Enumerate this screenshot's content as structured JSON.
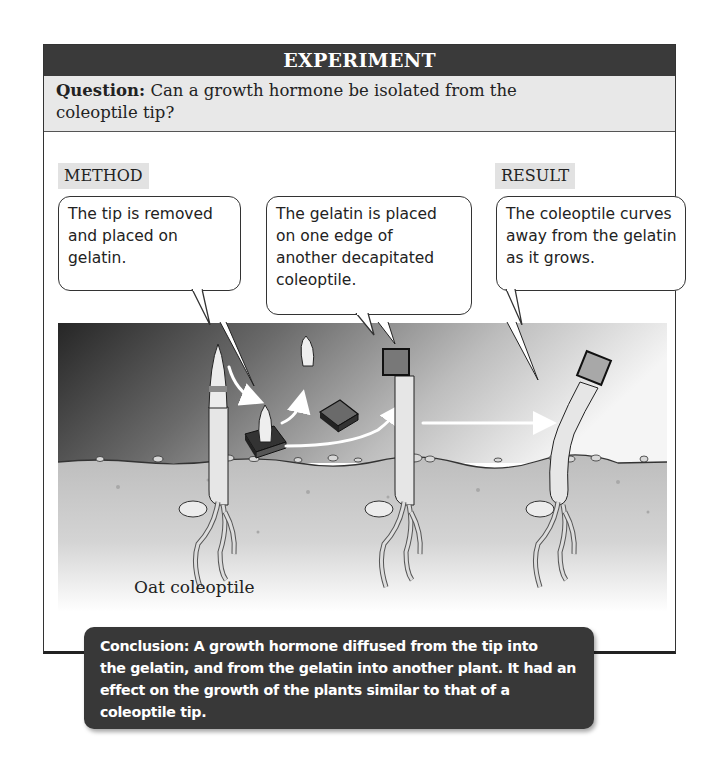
{
  "experiment": {
    "title": "EXPERIMENT",
    "question_label": "Question:",
    "question_text": " Can a growth hormone be isolated from the coleoptile tip?",
    "question_line1": " Can a growth hormone be isolated from the",
    "question_line2": "coleoptile tip?"
  },
  "sections": {
    "method_label": "METHOD",
    "result_label": "RESULT"
  },
  "callouts": [
    {
      "lines": [
        "The tip is removed",
        "and placed on",
        "gelatin."
      ]
    },
    {
      "lines": [
        "The gelatin is placed",
        "on one edge of",
        "another decapitated",
        "coleoptile."
      ]
    },
    {
      "lines": [
        "The coleoptile curves",
        "away from the gelatin",
        "as it grows."
      ]
    }
  ],
  "illustration": {
    "label": "Oat coleoptile",
    "colors": {
      "sky_dark": "#2e2e2e",
      "sky_light": "#f4f4f4",
      "soil": "#c9c9c9",
      "plant": "#e6e6e6",
      "gelatin": "#6a6a6a",
      "arrow": "#ffffff"
    }
  },
  "conclusion": {
    "lines": [
      "Conclusion:  A growth hormone diffused from the tip into",
      "the gelatin, and from the gelatin into another plant. It had an",
      "effect on the growth of the plants similar to that of a",
      "coleoptile tip."
    ]
  }
}
